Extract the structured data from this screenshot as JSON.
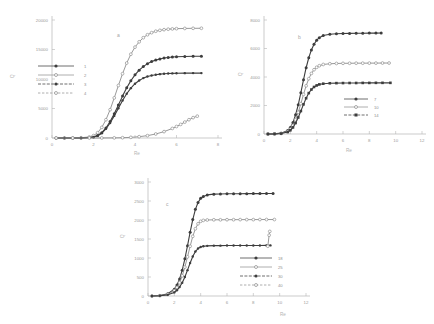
{
  "figure": {
    "background": "#ffffff",
    "ink": "#4a4a4a",
    "faint": "#9a9a9a"
  },
  "panels": [
    {
      "id": "panel-a",
      "label": "a",
      "xlabel": "Re",
      "ylabel": "Q",
      "xticks": [
        "0",
        "2",
        "4",
        "6",
        "8"
      ],
      "yticks": [
        "0",
        "5000",
        "10000",
        "15000",
        "20000"
      ],
      "legend_title": "",
      "legend": [
        "1",
        "2",
        "3",
        "4"
      ]
    },
    {
      "id": "panel-b",
      "label": "b",
      "xlabel": "Re",
      "ylabel": "Q",
      "xticks": [
        "0",
        "2",
        "4",
        "6",
        "8",
        "10",
        "12"
      ],
      "yticks": [
        "0",
        "2000",
        "4000",
        "6000",
        "8000"
      ],
      "legend_title": "",
      "legend": [
        "7",
        "10",
        "14"
      ]
    },
    {
      "id": "panel-c",
      "label": "c",
      "xlabel": "Re",
      "ylabel": "Q",
      "xticks": [
        "0",
        "2",
        "4",
        "6",
        "8",
        "10",
        "12"
      ],
      "yticks": [
        "0",
        "500",
        "1000",
        "1500",
        "2000",
        "2500",
        "3000"
      ],
      "legend_title": "",
      "legend": [
        "18",
        "25",
        "30",
        "40"
      ]
    }
  ],
  "chart_data": [
    {
      "type": "line",
      "title": "a",
      "xlabel": "Re",
      "ylabel": "Q",
      "xlim": [
        0,
        8
      ],
      "ylim": [
        0,
        20000
      ],
      "grid": false,
      "legend_position": "left-middle",
      "series": [
        {
          "name": "1",
          "marker": "filled-circle",
          "x": [
            0.2,
            0.6,
            1.0,
            1.4,
            1.8,
            2.0,
            2.2,
            2.4,
            2.6,
            2.8,
            3.0,
            3.2,
            3.4,
            3.6,
            3.8,
            4.0,
            4.2,
            4.4,
            4.6,
            4.8,
            5.0,
            5.2,
            5.4,
            5.6,
            5.8,
            6.0,
            6.4,
            6.8,
            7.2
          ],
          "y": [
            0,
            0,
            0,
            20,
            80,
            180,
            420,
            900,
            1700,
            2800,
            4100,
            5600,
            7100,
            8500,
            9700,
            10700,
            11500,
            12100,
            12600,
            12950,
            13200,
            13400,
            13550,
            13650,
            13720,
            13770,
            13820,
            13850,
            13860
          ]
        },
        {
          "name": "2",
          "marker": "open-circle",
          "x": [
            0.2,
            0.6,
            1.0,
            1.4,
            1.8,
            2.0,
            2.2,
            2.4,
            2.6,
            2.8,
            3.0,
            3.2,
            3.4,
            3.6,
            3.8,
            4.0,
            4.2,
            4.4,
            4.6,
            4.8,
            5.0,
            5.2,
            5.4,
            5.6,
            5.8,
            6.0,
            6.4,
            6.8,
            7.2
          ],
          "y": [
            0,
            0,
            10,
            50,
            180,
            400,
            900,
            1800,
            3100,
            4800,
            6800,
            8900,
            10900,
            12700,
            14200,
            15400,
            16300,
            17000,
            17500,
            17850,
            18100,
            18250,
            18360,
            18440,
            18490,
            18530,
            18570,
            18590,
            18600
          ]
        },
        {
          "name": "3",
          "marker": "filled-circle-small",
          "x": [
            0.2,
            0.6,
            1.0,
            1.4,
            1.8,
            2.0,
            2.2,
            2.4,
            2.6,
            2.8,
            3.0,
            3.2,
            3.4,
            3.6,
            3.8,
            4.0,
            4.2,
            4.4,
            4.6,
            4.8,
            5.0,
            5.2,
            5.4,
            5.6,
            5.8,
            6.0,
            6.4,
            6.8,
            7.2
          ],
          "y": [
            0,
            0,
            0,
            15,
            70,
            160,
            380,
            820,
            1550,
            2550,
            3750,
            5050,
            6350,
            7500,
            8450,
            9200,
            9750,
            10150,
            10420,
            10600,
            10730,
            10820,
            10880,
            10920,
            10950,
            10970,
            10990,
            11000,
            11000
          ]
        },
        {
          "name": "4",
          "marker": "open-triangle",
          "x": [
            0.2,
            1.0,
            1.8,
            2.4,
            3.0,
            3.4,
            3.8,
            4.2,
            4.6,
            5.0,
            5.4,
            5.8,
            6.0,
            6.2,
            6.4,
            6.6,
            6.8,
            7.0
          ],
          "y": [
            0,
            0,
            0,
            5,
            20,
            50,
            110,
            220,
            400,
            680,
            1080,
            1620,
            1950,
            2300,
            2700,
            3100,
            3450,
            3700
          ]
        }
      ]
    },
    {
      "type": "line",
      "title": "b",
      "xlabel": "Re",
      "ylabel": "Q",
      "xlim": [
        0,
        12
      ],
      "ylim": [
        0,
        8000
      ],
      "grid": false,
      "legend_position": "center-lower",
      "series": [
        {
          "name": "7",
          "marker": "filled-circle",
          "x": [
            0.3,
            0.8,
            1.3,
            1.8,
            2.0,
            2.2,
            2.4,
            2.6,
            2.8,
            3.0,
            3.2,
            3.4,
            3.6,
            3.8,
            4.0,
            4.2,
            4.5,
            5.0,
            5.5,
            6.0,
            6.5,
            7.0,
            7.5,
            8.0,
            8.5,
            8.9
          ],
          "y": [
            0,
            10,
            60,
            250,
            450,
            800,
            1350,
            2050,
            2900,
            3800,
            4650,
            5350,
            5900,
            6300,
            6580,
            6760,
            6910,
            7000,
            7030,
            7050,
            7060,
            7070,
            7075,
            7080,
            7080,
            7085
          ]
        },
        {
          "name": "10",
          "marker": "open-circle",
          "x": [
            0.3,
            0.8,
            1.3,
            1.8,
            2.0,
            2.2,
            2.4,
            2.6,
            2.8,
            3.0,
            3.2,
            3.4,
            3.6,
            3.8,
            4.0,
            4.2,
            4.5,
            5.0,
            5.5,
            6.0,
            6.5,
            7.0,
            7.5,
            8.0,
            8.5,
            9.0,
            9.5
          ],
          "y": [
            0,
            5,
            40,
            180,
            340,
            600,
            1000,
            1520,
            2130,
            2780,
            3380,
            3880,
            4250,
            4510,
            4680,
            4790,
            4880,
            4930,
            4950,
            4960,
            4965,
            4970,
            4970,
            4975,
            4975,
            4980,
            4980
          ]
        },
        {
          "name": "14",
          "marker": "filled-square",
          "x": [
            0.3,
            0.8,
            1.3,
            1.8,
            2.0,
            2.2,
            2.4,
            2.6,
            2.8,
            3.0,
            3.2,
            3.4,
            3.6,
            3.8,
            4.0,
            4.2,
            4.5,
            5.0,
            5.5,
            6.0,
            6.5,
            7.0,
            7.5,
            8.0,
            8.5,
            9.0,
            9.6
          ],
          "y": [
            0,
            4,
            30,
            140,
            260,
            460,
            770,
            1160,
            1610,
            2080,
            2510,
            2870,
            3120,
            3300,
            3410,
            3480,
            3530,
            3560,
            3570,
            3575,
            3580,
            3580,
            3585,
            3585,
            3590,
            3590,
            3590
          ]
        }
      ]
    },
    {
      "type": "line",
      "title": "c",
      "xlabel": "Re",
      "ylabel": "Q",
      "xlim": [
        0,
        12
      ],
      "ylim": [
        0,
        3000
      ],
      "grid": false,
      "legend_position": "center-lower",
      "series": [
        {
          "name": "18",
          "marker": "filled-circle",
          "x": [
            0.3,
            0.9,
            1.5,
            2.0,
            2.2,
            2.4,
            2.6,
            2.8,
            3.0,
            3.2,
            3.4,
            3.6,
            3.8,
            4.0,
            4.2,
            4.5,
            5.0,
            5.5,
            6.0,
            6.5,
            7.0,
            7.5,
            8.0,
            8.5,
            9.0,
            9.5
          ],
          "y": [
            0,
            10,
            60,
            180,
            290,
            450,
            680,
            980,
            1320,
            1680,
            2010,
            2280,
            2460,
            2570,
            2620,
            2660,
            2680,
            2685,
            2690,
            2690,
            2692,
            2694,
            2695,
            2695,
            2696,
            2696
          ]
        },
        {
          "name": "25",
          "marker": "open-circle",
          "x": [
            0.3,
            0.9,
            1.5,
            2.0,
            2.2,
            2.4,
            2.6,
            2.8,
            3.0,
            3.2,
            3.4,
            3.6,
            3.8,
            4.0,
            4.2,
            4.5,
            5.0,
            5.5,
            6.0,
            6.5,
            7.0,
            7.5,
            8.0,
            8.5,
            9.0,
            9.6
          ],
          "y": [
            0,
            8,
            45,
            140,
            225,
            350,
            530,
            760,
            1030,
            1310,
            1570,
            1770,
            1900,
            1965,
            1990,
            2000,
            2005,
            2005,
            2008,
            2008,
            2010,
            2010,
            2010,
            2012,
            2012,
            2012
          ]
        },
        {
          "name": "30",
          "marker": "filled-circle-small",
          "x": [
            0.3,
            0.9,
            1.5,
            2.0,
            2.2,
            2.4,
            2.6,
            2.8,
            3.0,
            3.2,
            3.4,
            3.6,
            3.8,
            4.0,
            4.2,
            4.5,
            5.0,
            5.5,
            6.0,
            6.5,
            7.0,
            7.5,
            8.0,
            8.5,
            9.0,
            9.3
          ],
          "y": [
            0,
            5,
            30,
            95,
            150,
            235,
            350,
            500,
            680,
            870,
            1040,
            1170,
            1250,
            1290,
            1310,
            1320,
            1325,
            1325,
            1328,
            1328,
            1330,
            1330,
            1330,
            1330,
            1332,
            1332
          ]
        },
        {
          "name": "40",
          "marker": "open-triangle",
          "x": [
            9.1,
            9.2,
            9.25
          ],
          "y": [
            1310,
            1600,
            1700
          ]
        }
      ]
    }
  ]
}
